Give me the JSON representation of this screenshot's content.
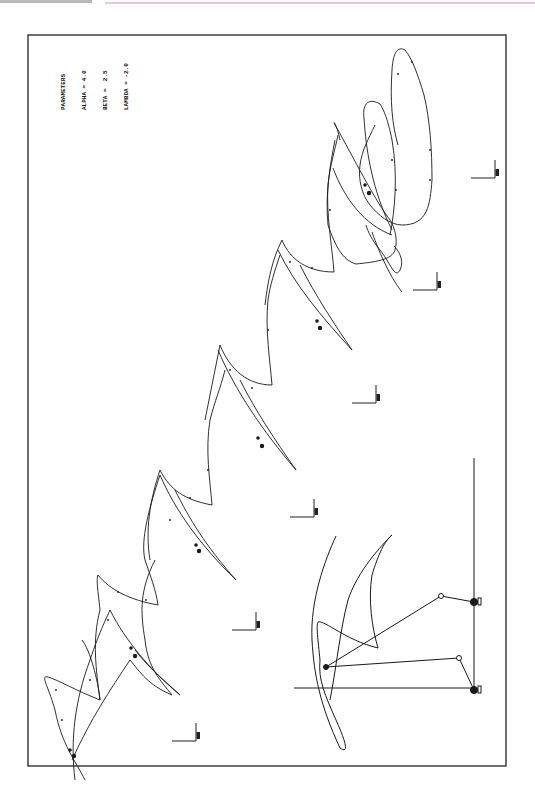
{
  "page": {
    "header_text": "",
    "frame": {
      "x": 28,
      "y": 35,
      "width": 478,
      "height": 731,
      "stroke": "#222222"
    }
  },
  "parameters": {
    "title": "PARAMETERS",
    "lines": [
      {
        "label": "ALPHA =",
        "value": "4.0"
      },
      {
        "label": "BETA =",
        "value": "2.5"
      },
      {
        "label": "LAMBDA =",
        "value": "-2.0"
      }
    ]
  },
  "diagram": {
    "type": "mechanism-gait-sequence",
    "stroke_color": "#1a1a1a",
    "ground_supports": [
      {
        "x": 196,
        "y": 741
      },
      {
        "x": 256,
        "y": 630
      },
      {
        "x": 314,
        "y": 517
      },
      {
        "x": 376,
        "y": 403
      },
      {
        "x": 437,
        "y": 290
      },
      {
        "x": 495,
        "y": 178
      }
    ],
    "linkage": {
      "ground_pivots": [
        {
          "x": 474,
          "y": 602
        },
        {
          "x": 474,
          "y": 690
        }
      ],
      "crank_joints": [
        {
          "x": 441,
          "y": 596
        },
        {
          "x": 459,
          "y": 658
        }
      ],
      "coupler_point": {
        "x": 326,
        "y": 667
      },
      "vertical_axis": {
        "x": 474,
        "y1": 458,
        "y2": 693
      },
      "horizontal_axis": {
        "y": 688,
        "x1": 294,
        "x2": 474
      }
    }
  }
}
